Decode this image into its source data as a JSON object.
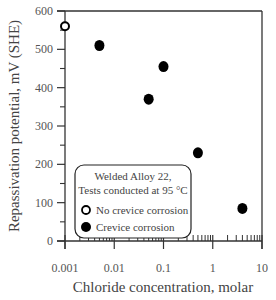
{
  "chart_data": {
    "type": "scatter",
    "title": "",
    "xlabel": "Chloride concentration, molar",
    "ylabel": "Repassivation potential, mV (SHE)",
    "xscale": "log",
    "xlim": [
      0.001,
      10
    ],
    "ylim": [
      0,
      600
    ],
    "x_ticks": [
      "0.001",
      "0.01",
      "0.1",
      "1",
      "10"
    ],
    "y_ticks": [
      "0",
      "100",
      "200",
      "300",
      "400",
      "500",
      "600"
    ],
    "grid": false,
    "legend_position": "lower-left inside",
    "legend_title": [
      "Welded Alloy 22,",
      "Tests conducted at 95 °C"
    ],
    "series": [
      {
        "name": "No crevice corrosion",
        "marker": "open-circle",
        "points": [
          {
            "x": 0.001,
            "y": 560
          }
        ]
      },
      {
        "name": "Crevice corrosion",
        "marker": "filled-circle",
        "points": [
          {
            "x": 0.005,
            "y": 510
          },
          {
            "x": 0.05,
            "y": 370
          },
          {
            "x": 0.1,
            "y": 455
          },
          {
            "x": 0.5,
            "y": 230
          },
          {
            "x": 4,
            "y": 85
          }
        ]
      }
    ]
  },
  "colors": {
    "axis": "#333333",
    "marker": "#000000",
    "text": "#444444"
  }
}
